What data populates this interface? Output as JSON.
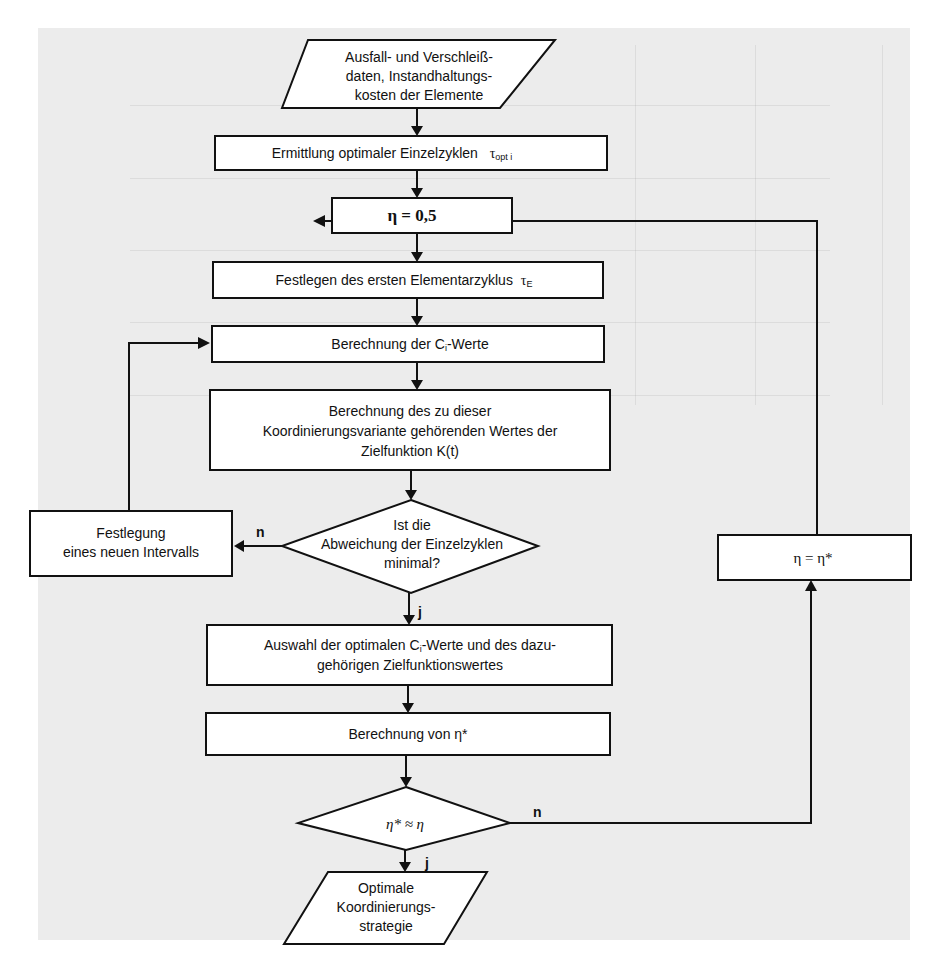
{
  "diagram": {
    "type": "flowchart",
    "nodes": {
      "input": {
        "shape": "parallelogram",
        "lines": [
          "Ausfall- und Verschleiß-",
          "daten, Instandhaltungs-",
          "kosten der Elemente"
        ]
      },
      "step1": {
        "shape": "rect",
        "text": "Ermittlung optimaler Einzelzyklen",
        "symbol": "τ",
        "subscript": "opt i"
      },
      "eta_init": {
        "shape": "rect",
        "text": "η = 0,5"
      },
      "step2": {
        "shape": "rect",
        "text": "Festlegen des ersten Elementarzyklus",
        "symbol": "τ",
        "subscript": "E"
      },
      "step3": {
        "shape": "rect",
        "text_pre": "Berechnung der C",
        "text_sub": "i",
        "text_post": "-Werte"
      },
      "step4": {
        "shape": "rect",
        "lines": [
          "Berechnung des zu dieser",
          "Koordinierungsvariante gehörenden Wertes der",
          "Zielfunktion K(t)"
        ]
      },
      "decision1": {
        "shape": "diamond",
        "lines": [
          "Ist die",
          "Abweichung der Einzelzyklen",
          "minimal?"
        ]
      },
      "new_interval": {
        "shape": "rect",
        "lines": [
          "Festlegung",
          "eines neuen Intervalls"
        ]
      },
      "step5": {
        "shape": "rect",
        "line1_pre": "Auswahl der optimalen C",
        "line1_sub": "i",
        "line1_post": "-Werte und des dazu-",
        "line2": "gehörigen Zielfunktionswertes"
      },
      "step6": {
        "shape": "rect",
        "text": "Berechnung von η*"
      },
      "decision2": {
        "shape": "diamond",
        "text": "η* ≈ η"
      },
      "eta_update": {
        "shape": "rect",
        "text": "η = η*"
      },
      "output": {
        "shape": "parallelogram",
        "lines": [
          "Optimale",
          "Koordinierungs-",
          "strategie"
        ]
      }
    },
    "edge_labels": {
      "yes": "j",
      "no": "n"
    }
  }
}
